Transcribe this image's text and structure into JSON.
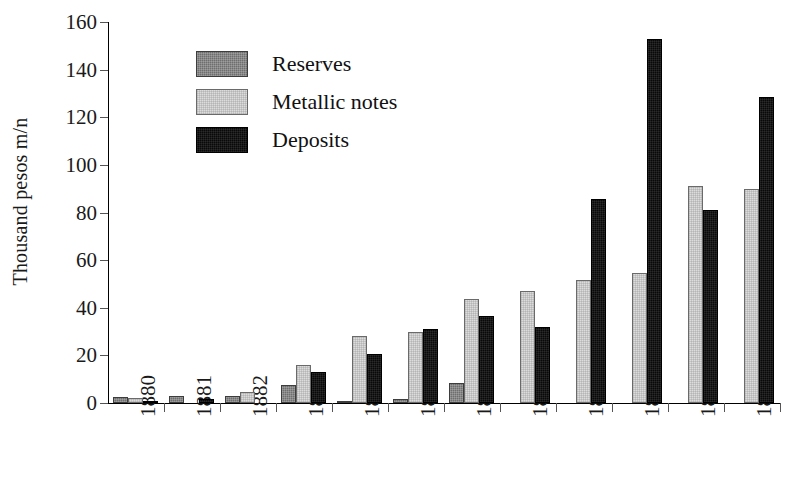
{
  "chart_data": {
    "type": "bar",
    "title": "",
    "xlabel": "",
    "ylabel": "Thousand pesos m/n",
    "ylim": [
      0,
      160
    ],
    "ytick_step": 20,
    "yticks": [
      0,
      20,
      40,
      60,
      80,
      100,
      120,
      140,
      160
    ],
    "grid": false,
    "legend_position": "upper-left-inside",
    "categories": [
      "1880",
      "1881",
      "1882",
      "1883",
      "1884",
      "1885",
      "1886",
      "1887",
      "1888",
      "1889",
      "1890",
      "1891"
    ],
    "series": [
      {
        "name": "Reserves",
        "color": "#6e6e6e",
        "values": [
          2.5,
          3.0,
          3.0,
          7.5,
          1.0,
          1.5,
          8.5,
          0,
          0,
          0,
          0,
          0
        ]
      },
      {
        "name": "Metallic notes",
        "color": "#dcdcdc",
        "values": [
          2.0,
          0,
          4.5,
          16.0,
          28.0,
          30.0,
          43.5,
          47.0,
          51.5,
          54.5,
          91.0,
          90.0
        ]
      },
      {
        "name": "Deposits",
        "color": "#090909",
        "values": [
          1.0,
          1.5,
          0,
          13.0,
          20.5,
          31.0,
          36.5,
          32.0,
          85.5,
          153.0,
          81.0,
          128.5
        ]
      }
    ]
  },
  "axis": {
    "y_title": "Thousand pesos m/n"
  },
  "legend": {
    "items": [
      {
        "label": "Reserves",
        "swatch": "dark-gray"
      },
      {
        "label": "Metallic notes",
        "swatch": "light-gray"
      },
      {
        "label": "Deposits",
        "swatch": "black"
      }
    ]
  }
}
